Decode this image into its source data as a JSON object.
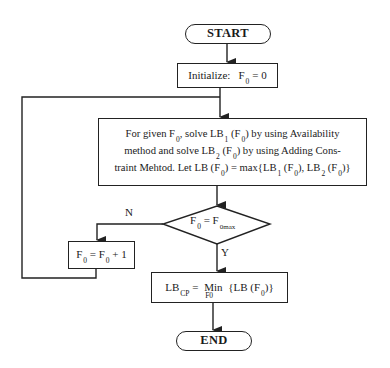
{
  "diagram": {
    "type": "flowchart",
    "nodes": {
      "start": {
        "shape": "terminal",
        "label": "START"
      },
      "initialize": {
        "shape": "process",
        "label": "Initialize:",
        "var": "F",
        "var_sub": "0",
        "rest": "= 0"
      },
      "solve": {
        "shape": "process",
        "lines": [
          {
            "a": "For given F",
            "a_sub": "0",
            "b": ", solve LB",
            "b_sub": "1",
            "c": " (F",
            "c_sub": "0",
            "d": ") by using Availability"
          },
          {
            "a": "method and solve LB",
            "a_sub": "2",
            "b": " (F",
            "b_sub": "0",
            "c": ") by using Adding Cons-"
          },
          {
            "a": "traint Mehtod. Let LB (F",
            "a_sub": "0",
            "b": ") = max{LB",
            "b_sub": "1",
            "c": " (F",
            "c_sub": "0",
            "d": "), LB",
            "d_sub": "2",
            "e": " (F",
            "e_sub": "0",
            "f": ")}"
          }
        ]
      },
      "decision": {
        "shape": "decision",
        "lhs": "F",
        "lhs_sub": "0",
        "op": " = F",
        "rhs_sub": "0max"
      },
      "increment": {
        "shape": "process",
        "lhs": "F",
        "lhs_sub": "0",
        "mid": " = F",
        "mid_sub": "0",
        "rest": " + 1"
      },
      "result": {
        "shape": "process",
        "lhs": "LB",
        "lhs_sub": "CP",
        "eq": " = ",
        "op": "Min",
        "op_sub": "F0",
        "rest": " {LB (F",
        "rest_sub": "0",
        "end": ")}"
      },
      "end": {
        "shape": "terminal",
        "label": "END"
      }
    },
    "edges": [
      {
        "from": "start",
        "to": "initialize"
      },
      {
        "from": "initialize",
        "to": "solve"
      },
      {
        "from": "solve",
        "to": "decision"
      },
      {
        "from": "decision",
        "to": "increment",
        "label": "N"
      },
      {
        "from": "decision",
        "to": "result",
        "label": "Y"
      },
      {
        "from": "increment",
        "to": "solve",
        "label": ""
      },
      {
        "from": "result",
        "to": "end"
      }
    ],
    "edge_labels": {
      "no": "N",
      "yes": "Y"
    },
    "colors": {
      "stroke": "#222222",
      "background": "#ffffff"
    }
  }
}
